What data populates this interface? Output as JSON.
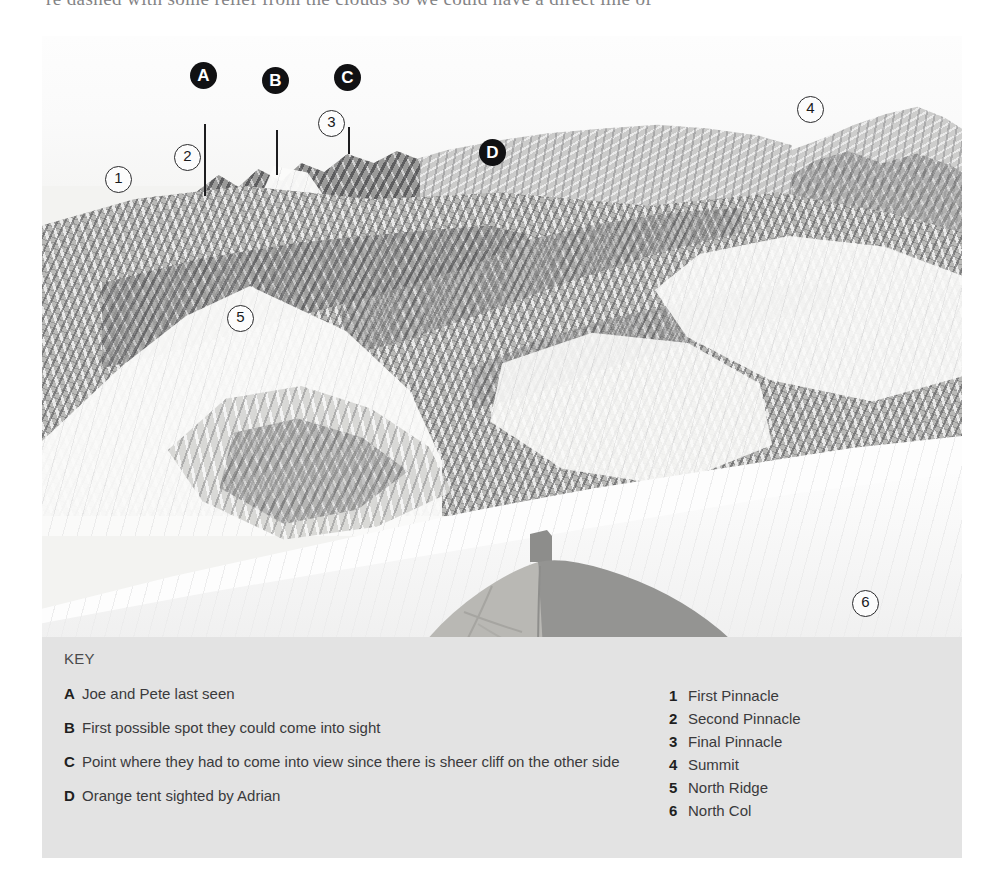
{
  "page": {
    "top_text_fragment": "re dashed with some relief from the clouds so we could have a direct line of"
  },
  "photo": {
    "alt_name": "everest-north-ridge-photo",
    "letter_markers": [
      {
        "id": "A",
        "label": "A",
        "x": 163,
        "y": 75,
        "leader_to_y": 160
      },
      {
        "id": "B",
        "label": "B",
        "x": 235,
        "y": 81,
        "leader_to_y": 139
      },
      {
        "id": "C",
        "label": "C",
        "x": 307,
        "y": 78,
        "leader_to_y": 118
      },
      {
        "id": "D",
        "label": "D",
        "x": 493,
        "y": 152,
        "leader_to_y": 0
      }
    ],
    "number_markers": [
      {
        "id": "1",
        "label": "1",
        "x": 117,
        "y": 178
      },
      {
        "id": "2",
        "label": "2",
        "x": 186,
        "y": 156
      },
      {
        "id": "3",
        "label": "3",
        "x": 330,
        "y": 122
      },
      {
        "id": "4",
        "label": "4",
        "x": 809,
        "y": 108
      },
      {
        "id": "5",
        "label": "5",
        "x": 239,
        "y": 317
      },
      {
        "id": "6",
        "label": "6",
        "x": 864,
        "y": 602
      }
    ]
  },
  "key": {
    "title": "KEY",
    "letter_entries": [
      {
        "letter": "A",
        "text": "Joe and Pete last seen"
      },
      {
        "letter": "B",
        "text": "First possible spot they could come into sight"
      },
      {
        "letter": "C",
        "text": "Point where they had to come into view since there is sheer cliff on the other side"
      },
      {
        "letter": "D",
        "text": "Orange tent sighted by Adrian"
      }
    ],
    "number_entries": [
      {
        "number": "1",
        "text": "First Pinnacle"
      },
      {
        "number": "2",
        "text": "Second Pinnacle"
      },
      {
        "number": "3",
        "text": "Final Pinnacle"
      },
      {
        "number": "4",
        "text": "Summit"
      },
      {
        "number": "5",
        "text": "North Ridge"
      },
      {
        "number": "6",
        "text": "North Col"
      }
    ]
  },
  "colors": {
    "key_panel_bg": "#e3e3e3",
    "marker_letter_bg": "#111113",
    "marker_letter_fg": "#ffffff",
    "marker_number_bg": "#fcfcfc",
    "marker_number_fg": "#1a1a1c",
    "page_bg": "#ffffff"
  }
}
